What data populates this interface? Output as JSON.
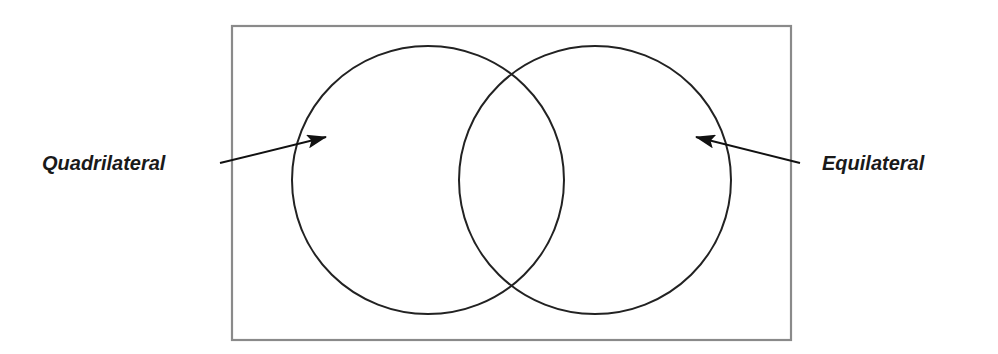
{
  "diagram": {
    "type": "venn",
    "universe": {
      "shape": "rectangle",
      "border_color": "#888888"
    },
    "sets": [
      {
        "name": "Quadrilateral",
        "label": "Quadrilateral",
        "position": "left",
        "stroke_color": "#222222"
      },
      {
        "name": "Equilateral",
        "label": "Equilateral",
        "position": "right",
        "stroke_color": "#222222"
      }
    ],
    "arrows": [
      {
        "from": "Quadrilateral label",
        "to": "left circle"
      },
      {
        "from": "Equilateral label",
        "to": "right circle"
      }
    ]
  },
  "labels": {
    "left": "Quadrilateral",
    "right": "Equilateral"
  }
}
